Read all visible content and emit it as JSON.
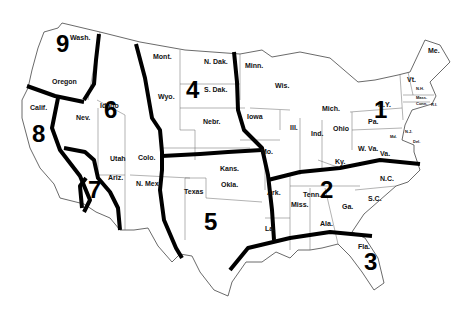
{
  "map": {
    "title": "US federal regions map",
    "regions": [
      {
        "number": "1",
        "x": 374,
        "y": 112
      },
      {
        "number": "2",
        "x": 320,
        "y": 192
      },
      {
        "number": "3",
        "x": 364,
        "y": 264
      },
      {
        "number": "4",
        "x": 186,
        "y": 92
      },
      {
        "number": "5",
        "x": 204,
        "y": 224
      },
      {
        "number": "6",
        "x": 104,
        "y": 112
      },
      {
        "number": "7",
        "x": 88,
        "y": 192
      },
      {
        "number": "8",
        "x": 32,
        "y": 136
      },
      {
        "number": "9",
        "x": 56,
        "y": 46
      }
    ],
    "states": [
      {
        "name": "Wash.",
        "x": 70,
        "y": 34
      },
      {
        "name": "Oregon",
        "x": 52,
        "y": 78
      },
      {
        "name": "Calif.",
        "x": 30,
        "y": 104
      },
      {
        "name": "Idaho",
        "x": 100,
        "y": 102
      },
      {
        "name": "Nev.",
        "x": 76,
        "y": 114
      },
      {
        "name": "Utah",
        "x": 110,
        "y": 155
      },
      {
        "name": "Ariz.",
        "x": 108,
        "y": 174
      },
      {
        "name": "Colo.",
        "x": 138,
        "y": 154
      },
      {
        "name": "N. Mex.",
        "x": 136,
        "y": 180
      },
      {
        "name": "Mont.",
        "x": 153,
        "y": 53
      },
      {
        "name": "Wyo.",
        "x": 158,
        "y": 93
      },
      {
        "name": "N. Dak.",
        "x": 204,
        "y": 58
      },
      {
        "name": "S. Dak.",
        "x": 204,
        "y": 86
      },
      {
        "name": "Nebr.",
        "x": 203,
        "y": 118
      },
      {
        "name": "Kans.",
        "x": 220,
        "y": 165
      },
      {
        "name": "Okla.",
        "x": 221,
        "y": 181
      },
      {
        "name": "Texas",
        "x": 184,
        "y": 188
      },
      {
        "name": "Minn.",
        "x": 245,
        "y": 62
      },
      {
        "name": "Wis.",
        "x": 275,
        "y": 82
      },
      {
        "name": "Iowa",
        "x": 247,
        "y": 113
      },
      {
        "name": "Ill.",
        "x": 290,
        "y": 124
      },
      {
        "name": "Ind.",
        "x": 311,
        "y": 130
      },
      {
        "name": "Ohio",
        "x": 333,
        "y": 125
      },
      {
        "name": "Mich.",
        "x": 322,
        "y": 105
      },
      {
        "name": "Mo.",
        "x": 261,
        "y": 148
      },
      {
        "name": "Ky.",
        "x": 335,
        "y": 158
      },
      {
        "name": "W. Va.",
        "x": 358,
        "y": 145
      },
      {
        "name": "Va.",
        "x": 380,
        "y": 150
      },
      {
        "name": "Pa.",
        "x": 368,
        "y": 118
      },
      {
        "name": "N.Y.",
        "x": 378,
        "y": 101
      },
      {
        "name": "Vt.",
        "x": 407,
        "y": 76
      },
      {
        "name": "Me.",
        "x": 428,
        "y": 47
      },
      {
        "name": "N.H.",
        "x": 416,
        "y": 87,
        "small": true
      },
      {
        "name": "Mass.",
        "x": 416,
        "y": 96,
        "small": true
      },
      {
        "name": "Conn.",
        "x": 416,
        "y": 102,
        "small": true
      },
      {
        "name": "R.I.",
        "x": 431,
        "y": 103,
        "small": true
      },
      {
        "name": "N.J.",
        "x": 405,
        "y": 130,
        "small": true
      },
      {
        "name": "Md.",
        "x": 390,
        "y": 135,
        "small": true
      },
      {
        "name": "Del.",
        "x": 413,
        "y": 140,
        "small": true
      },
      {
        "name": "N.C.",
        "x": 380,
        "y": 175
      },
      {
        "name": "Tenn.",
        "x": 303,
        "y": 191
      },
      {
        "name": "Ark.",
        "x": 267,
        "y": 189
      },
      {
        "name": "Miss.",
        "x": 291,
        "y": 201
      },
      {
        "name": "Ala.",
        "x": 320,
        "y": 220
      },
      {
        "name": "Ga.",
        "x": 342,
        "y": 203
      },
      {
        "name": "S.C.",
        "x": 368,
        "y": 195
      },
      {
        "name": "La.",
        "x": 265,
        "y": 225
      },
      {
        "name": "Fla.",
        "x": 358,
        "y": 243
      }
    ]
  }
}
